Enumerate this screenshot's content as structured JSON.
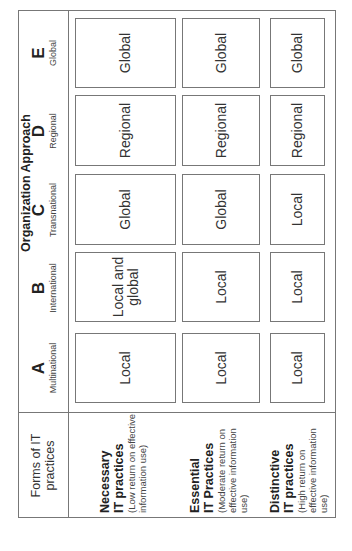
{
  "header": {
    "corner_label": "Forms of IT practices",
    "title": "Organization Approach",
    "columns": [
      {
        "letter": "A",
        "name": "Multinational"
      },
      {
        "letter": "B",
        "name": "International"
      },
      {
        "letter": "C",
        "name": "Transnational"
      },
      {
        "letter": "D",
        "name": "Regional"
      },
      {
        "letter": "E",
        "name": "Global"
      }
    ]
  },
  "rows": [
    {
      "title1": "Necessary",
      "title2": "IT practices",
      "desc": "(Low return on effective information use)",
      "cells": [
        "Local",
        "Local and global",
        "Global",
        "Regional",
        "Global"
      ]
    },
    {
      "title1": "Essential",
      "title2": "IT Practices",
      "desc": "(Moderate return on effective information use)",
      "cells": [
        "Local",
        "Local",
        "Global",
        "Regional",
        "Global"
      ]
    },
    {
      "title1": "Distinctive",
      "title2": "IT practices",
      "desc": "(High return on effective information use)",
      "cells": [
        "Local",
        "Local",
        "Local",
        "Regional",
        "Global"
      ]
    }
  ]
}
